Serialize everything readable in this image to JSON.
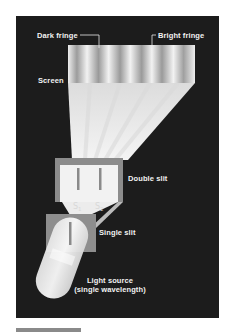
{
  "diagram": {
    "colors": {
      "background": "#1c1c1c",
      "light": "#efefef",
      "fringe_dark": "#9a9a9a",
      "slit_frame": "#8c8c8c",
      "text": "#f2f2f2"
    },
    "labels": {
      "dark_fringe": "Dark fringe",
      "bright_fringe": "Bright fringe",
      "screen": "Screen",
      "double_slit": "Double slit",
      "single_slit": "Single slit",
      "light_source_line1": "Light source",
      "light_source_line2": "(single wavelength)",
      "s1_letter": "S",
      "s1_sub": "1",
      "s2_letter": "S",
      "s2_sub": "2"
    },
    "components": [
      {
        "name": "Light source",
        "note": "single wavelength"
      },
      {
        "name": "Single slit"
      },
      {
        "name": "Double slit",
        "slits": [
          "S1",
          "S2"
        ]
      },
      {
        "name": "Screen",
        "dark_fringes": 6
      }
    ]
  }
}
